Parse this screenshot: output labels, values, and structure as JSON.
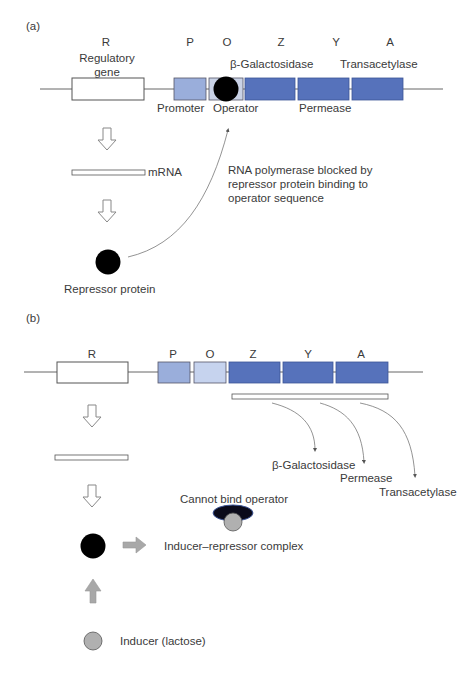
{
  "panel_a": {
    "tag": "(a)",
    "gene_letters": [
      "R",
      "P",
      "O",
      "Z",
      "Y",
      "A"
    ],
    "regulatory_gene_label": "Regulatory gene",
    "regulatory_gene_line1": "Regulatory",
    "regulatory_gene_line2": "gene",
    "enzyme_labels": {
      "z": "β-Galactosidase",
      "y": "Permease",
      "a": "Transacetylase"
    },
    "promoter_label": "Promoter",
    "operator_label": "Operator",
    "mrna_label": "mRNA",
    "note_line1": "RNA polymerase blocked by",
    "note_line2": "repressor protein binding to",
    "note_line3": "operator sequence",
    "repressor_label": "Repressor protein"
  },
  "panel_b": {
    "tag": "(b)",
    "gene_letters": [
      "R",
      "P",
      "O",
      "Z",
      "Y",
      "A"
    ],
    "products": [
      "β-Galactosidase",
      "Permease",
      "Transacetylase"
    ],
    "cannot_bind_label": "Cannot bind operator",
    "complex_label": "Inducer–repressor complex",
    "inducer_label": "Inducer (lactose)"
  },
  "colors": {
    "promoter": "#9aaedb",
    "operator_b": "#c6d3ee",
    "operator_a": "#c9d2e6",
    "structural": "#5672bb",
    "structural_border": "#3d5596",
    "repressor": "#000000",
    "inducer": "#b0b0b0",
    "dna_line": "#555555"
  }
}
